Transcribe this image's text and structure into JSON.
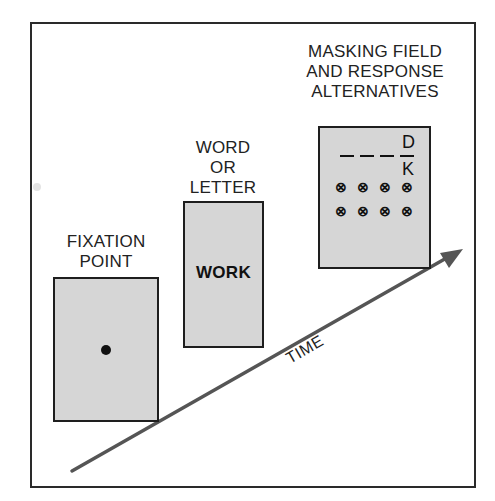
{
  "figure": {
    "type": "experimental-timeline-diagram",
    "stages": [
      {
        "id": "fixation",
        "label_lines": [
          "FIXATION",
          "POINT"
        ],
        "content": "dot"
      },
      {
        "id": "word",
        "label_lines": [
          "WORD",
          "OR",
          "LETTER"
        ],
        "content": "WORK"
      },
      {
        "id": "mask",
        "label_lines": [
          "MASKING FIELD",
          "AND RESPONSE",
          "ALTERNATIVES"
        ],
        "content": {
          "top_alternative": "D",
          "bottom_alternative": "K",
          "blank_slots": 4,
          "mask_symbol": "⊗",
          "mask_rows": 2,
          "mask_cols": 4
        }
      }
    ],
    "axis": {
      "label": "TIME",
      "direction": "up-right"
    },
    "colors": {
      "panel_fill": "#d6d6d6",
      "border": "#1e1e1e",
      "arrow": "#555555",
      "background": "#ffffff"
    }
  }
}
